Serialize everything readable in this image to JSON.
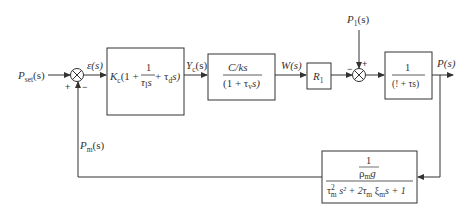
{
  "diagram": {
    "type": "control-loop block diagram",
    "signals": {
      "setpoint": "P",
      "setpoint_sub": "set",
      "setpoint_arg": "(s)",
      "error": "ε(s)",
      "controller_out": "Y",
      "controller_out_sub": "c",
      "controller_out_arg": "(s)",
      "flow": "W(s)",
      "disturbance": "P",
      "disturbance_sub": "1",
      "disturbance_arg": "(s)",
      "output": "P(s)",
      "measured": "P",
      "measured_sub": "m",
      "measured_arg": "(s)"
    },
    "junctions": [
      {
        "id": "sum1",
        "signs": {
          "left": "+",
          "bottom": "−"
        }
      },
      {
        "id": "sum2",
        "signs": {
          "left": "−",
          "top": "+"
        }
      }
    ],
    "blocks": {
      "controller": {
        "gain": "K",
        "gain_sub": "c",
        "open": "(1 + ",
        "frac_num": "1",
        "frac_den": "τ",
        "frac_den_sub": "I",
        "frac_den_tail": "s",
        "plus": " + τ",
        "deriv_sub": "d",
        "close": "s)"
      },
      "valve": {
        "numerator": "C/ks",
        "denominator": "(1 + τ",
        "den_sub": "v",
        "den_tail": "s)"
      },
      "resistance": {
        "label": "R",
        "label_sub": "1"
      },
      "process": {
        "numerator": "1",
        "denominator": "(! + τs)"
      },
      "sensor": {
        "top_num": "1",
        "top_den": "ρ",
        "top_den_sub": "m",
        "top_den_tail": "g",
        "den_a": "τ",
        "den_a_sup": "2",
        "den_a_sub": "m",
        "den_b": " s² + 2τ",
        "den_b_sub": "m",
        "den_c": " ξ",
        "den_c_sub": "m",
        "den_d": "s + 1"
      }
    }
  }
}
